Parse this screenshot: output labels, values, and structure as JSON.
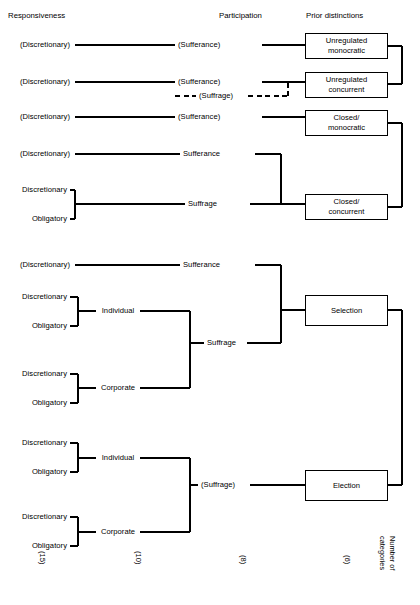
{
  "figure": {
    "type": "tree-diagram",
    "headers": [
      {
        "label": "Responsiveness",
        "x": 8,
        "y": 12
      },
      {
        "label": "Participation",
        "x": 219,
        "y": 12
      },
      {
        "label": "Prior distinctions",
        "x": 306,
        "y": 12
      }
    ],
    "responsiveness": [
      {
        "label": "(Discretionary)",
        "x": 70,
        "y": 45
      },
      {
        "label": "(Discretionary)",
        "x": 70,
        "y": 82
      },
      {
        "label": "(Discretionary)",
        "x": 70,
        "y": 117
      },
      {
        "label": "(Discretionary)",
        "x": 70,
        "y": 154
      },
      {
        "label": "Discretionary",
        "x": 62,
        "y": 190
      },
      {
        "label": "Obligatory",
        "x": 62,
        "y": 219
      },
      {
        "label": "(Discretionary)",
        "x": 70,
        "y": 265
      },
      {
        "label": "Discretionary",
        "x": 62,
        "y": 297
      },
      {
        "label": "Obligatory",
        "x": 62,
        "y": 326
      },
      {
        "label": "Discretionary",
        "x": 62,
        "y": 374
      },
      {
        "label": "Obligatory",
        "x": 62,
        "y": 403
      },
      {
        "label": "Discretionary",
        "x": 62,
        "y": 443
      },
      {
        "label": "Obligatory",
        "x": 62,
        "y": 472
      },
      {
        "label": "Discretionary",
        "x": 62,
        "y": 517
      },
      {
        "label": "Obligatory",
        "x": 62,
        "y": 546
      }
    ],
    "intermediate": [
      {
        "label": "Individual",
        "x": 117,
        "y": 311
      },
      {
        "label": "Corporate",
        "x": 117,
        "y": 388
      },
      {
        "label": "Individual",
        "x": 117,
        "y": 458
      },
      {
        "label": "Corporate",
        "x": 117,
        "y": 532
      }
    ],
    "participation": [
      {
        "label": "(Sufferance)",
        "x": 219,
        "y": 45,
        "style": "solid"
      },
      {
        "label": "(Sufferance)",
        "x": 219,
        "y": 82,
        "style": "solid"
      },
      {
        "label": "(Suffrage)",
        "x": 219,
        "y": 96,
        "style": "dashed"
      },
      {
        "label": "(Sufferance)",
        "x": 219,
        "y": 117,
        "style": "solid"
      },
      {
        "label": "Sufferance",
        "x": 219,
        "y": 154,
        "style": "solid"
      },
      {
        "label": "Suffrage",
        "x": 219,
        "y": 204,
        "style": "solid"
      },
      {
        "label": "Sufferance",
        "x": 219,
        "y": 265,
        "style": "solid"
      },
      {
        "label": "Suffrage",
        "x": 219,
        "y": 343,
        "style": "solid"
      },
      {
        "label": "(Suffrage)",
        "x": 219,
        "y": 485,
        "style": "solid"
      }
    ],
    "boxes": [
      {
        "lines": [
          "Unregulated",
          "monocratic"
        ],
        "x": 305,
        "y": 33,
        "w": 83,
        "h": 26
      },
      {
        "lines": [
          "Unregulated",
          "concurrent"
        ],
        "x": 305,
        "y": 72,
        "w": 83,
        "h": 26
      },
      {
        "lines": [
          "Closed/",
          "monocratic"
        ],
        "x": 305,
        "y": 110,
        "w": 83,
        "h": 26
      },
      {
        "lines": [
          "Closed/",
          "concurrent"
        ],
        "x": 305,
        "y": 194,
        "w": 83,
        "h": 26
      },
      {
        "lines": [
          "Selection"
        ],
        "x": 305,
        "y": 295,
        "w": 83,
        "h": 31
      },
      {
        "lines": [
          "Election"
        ],
        "x": 305,
        "y": 470,
        "w": 83,
        "h": 31
      }
    ],
    "counts": [
      {
        "label": "(15)",
        "x": 42,
        "y": 560
      },
      {
        "label": "(10)",
        "x": 138,
        "y": 560
      },
      {
        "label": "(8)",
        "x": 243,
        "y": 562
      },
      {
        "label": "(6)",
        "x": 347,
        "y": 562
      }
    ],
    "axis_caption": {
      "line1": "Number of",
      "line2": "categories",
      "x": 385,
      "y": 536
    }
  }
}
